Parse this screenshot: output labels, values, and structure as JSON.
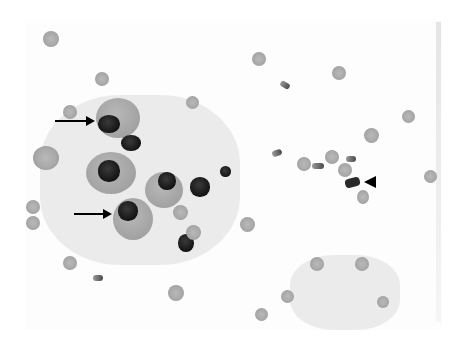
{
  "image": {
    "type": "grayscale light micrograph",
    "description": "Cytology smear with scattered red blood cells, large cells with dark nuclei, and annotation pointers",
    "background_color": "#ffffff"
  },
  "annotations": {
    "arrows": [
      {
        "label": "arrow-upper",
        "direction": "right",
        "x1": 55,
        "y1": 121,
        "x2": 95,
        "y2": 121
      },
      {
        "label": "arrow-lower",
        "direction": "right",
        "x1": 74,
        "y1": 214,
        "x2": 112,
        "y2": 214
      }
    ],
    "arrowheads": [
      {
        "label": "arrowhead-right-cluster",
        "direction": "left",
        "x": 364,
        "y": 182
      }
    ]
  }
}
